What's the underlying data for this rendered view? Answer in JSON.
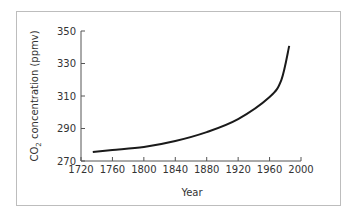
{
  "chart_data": {
    "type": "line",
    "title": "",
    "xlabel": "Year",
    "ylabel": "CO2 concentration (ppmv)",
    "ylabel_parts": {
      "prefix": "CO",
      "subscript": "2",
      "suffix": " concentration (ppmv)"
    },
    "xlim": [
      1720,
      2000
    ],
    "ylim": [
      270,
      350
    ],
    "xticks": [
      "1720",
      "1760",
      "1800",
      "1840",
      "1880",
      "1920",
      "1960",
      "2000"
    ],
    "yticks": [
      "270",
      "290",
      "310",
      "330",
      "350"
    ],
    "grid": false,
    "legend": null,
    "series": [
      {
        "name": "CO2 concentration",
        "color": "#1a1a1a",
        "x": [
          1735,
          1760,
          1800,
          1840,
          1880,
          1920,
          1960,
          1975,
          1985
        ],
        "y": [
          275.5,
          276.8,
          278.6,
          282.3,
          287.8,
          295.8,
          309.4,
          320.0,
          340.8
        ]
      }
    ]
  }
}
